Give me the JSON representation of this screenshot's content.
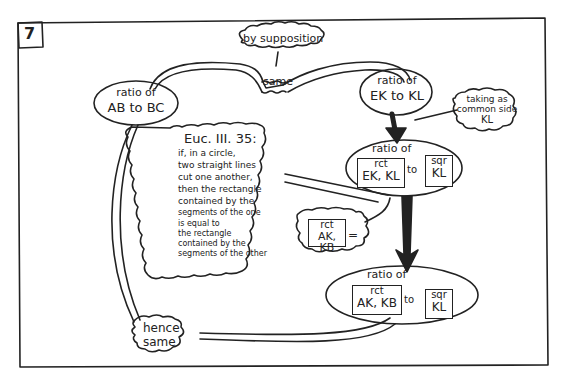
{
  "panel": {
    "number": "7",
    "stroke_color": "#222222",
    "background": "#ffffff"
  },
  "nodes": {
    "by_supposition": {
      "label": "by supposition",
      "shape": "cloud"
    },
    "same_top": {
      "label": "same",
      "shape": "banner"
    },
    "ratio_ab_bc": {
      "line1": "ratio of",
      "line2": "AB to BC",
      "shape": "ellipse"
    },
    "ratio_ek_kl": {
      "line1": "ratio of",
      "line2": "EK to KL",
      "shape": "ellipse"
    },
    "taking_common": {
      "line1": "taking as",
      "line2": "common side",
      "line3": "KL",
      "shape": "cloud"
    },
    "euclid": {
      "title": "Euc. III. 35:",
      "lines": [
        "if, in a circle,",
        "two straight lines",
        "cut one another,",
        "then the rectangle",
        "contained by the",
        "segments of the one",
        "is equal to",
        "the rectangle",
        "contained by the",
        "segments of the other"
      ],
      "shape": "cloud"
    },
    "ratio_rct_ek_kl": {
      "title": "ratio of",
      "left_box": {
        "line1": "rct",
        "line2": "EK, KL"
      },
      "connector": "to",
      "right_box": {
        "line1": "sqr",
        "line2": "KL"
      },
      "shape": "ellipse"
    },
    "rct_ak_kb_equals": {
      "line1": "rct",
      "line2": "AK, KB",
      "suffix": "=",
      "shape": "cloud"
    },
    "ratio_rct_ak_kb": {
      "title": "ratio of",
      "left_box": {
        "line1": "rct",
        "line2": "AK, KB"
      },
      "connector": "to",
      "right_box": {
        "line1": "sqr",
        "line2": "KL"
      },
      "shape": "ellipse"
    },
    "hence_same": {
      "line1": "hence",
      "line2": "same",
      "shape": "cloud"
    }
  }
}
